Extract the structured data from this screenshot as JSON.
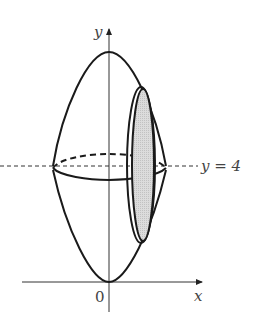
{
  "figure": {
    "type": "solid-of-revolution",
    "axes": {
      "x_label": "x",
      "y_label": "y",
      "origin_label": "0"
    },
    "axis_of_rotation": {
      "label": "y = 4",
      "style": "dashed"
    },
    "colors": {
      "stroke": "#1a1a1a",
      "slice_fill": "#d4d4d4",
      "text": "#444444"
    }
  }
}
